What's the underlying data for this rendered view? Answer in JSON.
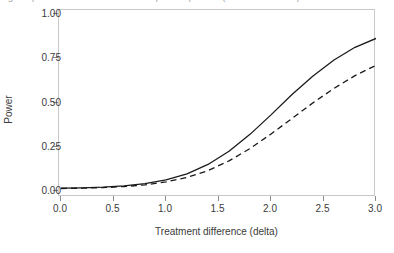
{
  "caption_sliver": {
    "text": "Figure: power curves for the two-sample comparison (solid and dashed)"
  },
  "chart_data": {
    "type": "line",
    "title": "",
    "subtitle": "",
    "xlabel": "Treatment difference (delta)",
    "ylabel": "Power",
    "xlim": [
      0.0,
      3.0
    ],
    "ylim": [
      0.0,
      1.0
    ],
    "xticks": [
      0.0,
      0.5,
      1.0,
      1.5,
      2.0,
      2.5,
      3.0
    ],
    "xtick_labels": [
      "0.0",
      "0.5",
      "1.0",
      "1.5",
      "2.0",
      "2.5",
      "3.0"
    ],
    "yticks": [
      0.0,
      0.25,
      0.5,
      0.75,
      1.0
    ],
    "ytick_labels": [
      "0.00",
      "0.25",
      "0.50",
      "0.75",
      "1.00"
    ],
    "grid": false,
    "legend": "none",
    "panel_border_color": "#c9c9c9",
    "line_color": "#1a1a1a",
    "background": "#ffffff",
    "x": [
      0.0,
      0.2,
      0.4,
      0.6,
      0.8,
      1.0,
      1.2,
      1.4,
      1.6,
      1.8,
      2.0,
      2.2,
      2.4,
      2.6,
      2.8,
      3.0
    ],
    "series": [
      {
        "name": "solid",
        "style": "solid",
        "values": [
          0.016,
          0.018,
          0.022,
          0.029,
          0.042,
          0.063,
          0.097,
          0.15,
          0.225,
          0.32,
          0.43,
          0.545,
          0.65,
          0.74,
          0.812,
          0.862
        ]
      },
      {
        "name": "dashed",
        "style": "dashed",
        "values": [
          0.014,
          0.016,
          0.019,
          0.025,
          0.035,
          0.051,
          0.077,
          0.115,
          0.17,
          0.24,
          0.322,
          0.41,
          0.498,
          0.58,
          0.652,
          0.71
        ]
      }
    ]
  }
}
